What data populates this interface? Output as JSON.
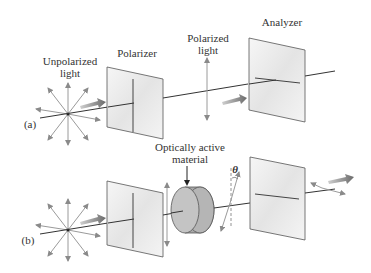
{
  "diagram": {
    "panels": [
      {
        "id": "a",
        "tag": "(a)",
        "labels": {
          "unpolarized_line1": "Unpolarized",
          "unpolarized_line2": "light",
          "polarizer": "Polarizer",
          "polarized_line1": "Polarized",
          "polarized_line2": "light",
          "analyzer": "Analyzer"
        }
      },
      {
        "id": "b",
        "tag": "(b)",
        "labels": {
          "material_line1": "Optically active",
          "material_line2": "material",
          "angle": "θ"
        }
      }
    ],
    "colors": {
      "arrow_gray": "#8a8a8a",
      "plate_fill": "#eeeeee",
      "plate_edge": "#555555",
      "beam": "#333333",
      "cylinder_fill": "#b8b8b8"
    }
  }
}
